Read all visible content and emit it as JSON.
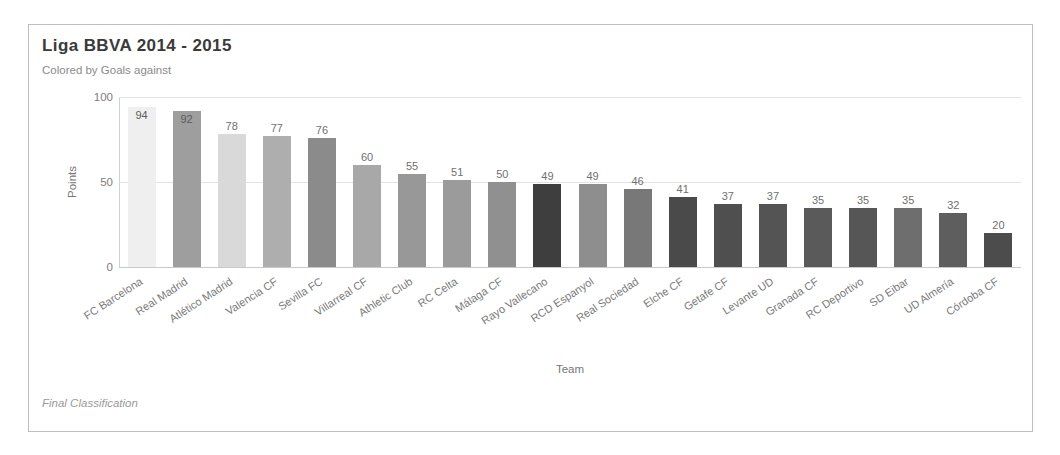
{
  "frame": {
    "title": "Liga BBVA 2014 - 2015",
    "subtitle": "Colored by Goals against",
    "footer": "Final Classification"
  },
  "axes": {
    "y_title": "Points",
    "x_title": "Team",
    "y_ticks": [
      "0",
      "50",
      "100"
    ]
  },
  "chart_data": {
    "type": "bar",
    "title": "Liga BBVA 2014 - 2015",
    "subtitle": "Colored by Goals against",
    "footer": "Final Classification",
    "xlabel": "Team",
    "ylabel": "Points",
    "ylim": [
      0,
      100
    ],
    "yticks": [
      0,
      50,
      100
    ],
    "grid": true,
    "legend": false,
    "color_encoding": "Goals against",
    "categories": [
      "FC Barcelona",
      "Real Madrid",
      "Atlético Madrid",
      "Valencia CF",
      "Sevilla FC",
      "Villarreal CF",
      "Athletic Club",
      "RC Celta",
      "Málaga CF",
      "Rayo Vallecano",
      "RCD Espanyol",
      "Real Sociedad",
      "Elche CF",
      "Getafe CF",
      "Levante UD",
      "Granada CF",
      "RC Deportivo",
      "SD Eibar",
      "UD Almería",
      "Córdoba CF"
    ],
    "values": [
      94,
      92,
      78,
      77,
      76,
      60,
      55,
      51,
      50,
      49,
      49,
      46,
      41,
      37,
      37,
      35,
      35,
      35,
      32,
      20
    ],
    "bar_colors": [
      "#efefef",
      "#9e9e9e",
      "#d9d9d9",
      "#aeaeae",
      "#8b8b8b",
      "#a8a8a8",
      "#989898",
      "#9b9b9b",
      "#909090",
      "#3e3e3e",
      "#8e8e8e",
      "#787878",
      "#4a4a4a",
      "#4f4f4f",
      "#545454",
      "#5a5a5a",
      "#565656",
      "#6e6e6e",
      "#5e5e5e",
      "#4c4c4c"
    ],
    "value_label_inside": [
      true,
      true,
      false,
      false,
      false,
      false,
      false,
      false,
      false,
      false,
      false,
      false,
      false,
      false,
      false,
      false,
      false,
      false,
      false,
      false
    ]
  }
}
